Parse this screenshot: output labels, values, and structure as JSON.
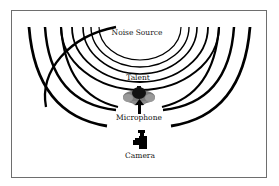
{
  "diagram": {
    "type": "audio-pickup-pattern",
    "labels": {
      "noise_source": "Noise Source",
      "talent": "Talent",
      "microphone": "Microphone",
      "camera": "Camera"
    },
    "elements": [
      {
        "id": "noise-source",
        "label": "Noise Source",
        "shape": "concentric-arcs",
        "count": 8
      },
      {
        "id": "talent",
        "label": "Talent",
        "shape": "person-top-view"
      },
      {
        "id": "microphone",
        "label": "Microphone",
        "shape": "arrow-up"
      },
      {
        "id": "camera",
        "label": "Camera",
        "shape": "camera-operator"
      }
    ],
    "colors": {
      "arcs": "#000000",
      "frame": "#6e6e6e",
      "talent_body": "#7a7a7a",
      "talent_head": "#111111"
    }
  }
}
